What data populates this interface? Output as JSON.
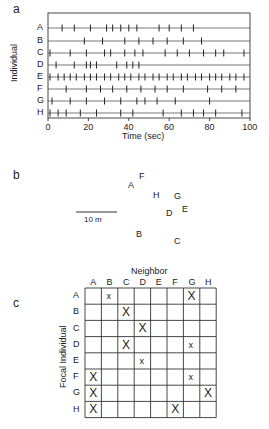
{
  "panels": {
    "a": {
      "label": "a"
    },
    "b": {
      "label": "b"
    },
    "c": {
      "label": "c"
    }
  },
  "chart_data": [
    {
      "type": "scatter",
      "subtype": "raster",
      "panel": "a",
      "xlabel": "Time (sec)",
      "ylabel": "Individual",
      "xlim": [
        0,
        100
      ],
      "xticks": [
        0,
        20,
        40,
        60,
        80,
        100
      ],
      "categories": [
        "A",
        "B",
        "C",
        "D",
        "E",
        "F",
        "G",
        "H"
      ],
      "series": [
        {
          "name": "A",
          "values": [
            7,
            13,
            21,
            29,
            32,
            36,
            40,
            44,
            55,
            60,
            66,
            72
          ]
        },
        {
          "name": "B",
          "values": [
            18,
            27,
            38,
            45,
            52,
            59,
            67,
            76
          ]
        },
        {
          "name": "C",
          "values": [
            1,
            11,
            19,
            28,
            31,
            38,
            43,
            47,
            58,
            64,
            70,
            77,
            83,
            87,
            97
          ]
        },
        {
          "name": "D",
          "values": [
            4,
            13,
            19,
            21,
            24,
            34,
            39,
            42,
            45
          ]
        },
        {
          "name": "E",
          "values": [
            1,
            5,
            8,
            11,
            14,
            18,
            21,
            24,
            28,
            31,
            35,
            38,
            41,
            45,
            48,
            52,
            55,
            59,
            62,
            66,
            69,
            73,
            76,
            80,
            83,
            86,
            90,
            93,
            97
          ]
        },
        {
          "name": "F",
          "values": [
            9,
            19,
            26,
            32,
            39,
            46,
            53,
            59,
            67,
            79,
            86,
            93
          ]
        },
        {
          "name": "G",
          "values": [
            2,
            11,
            19,
            28,
            36,
            44,
            48,
            54,
            63,
            80
          ]
        },
        {
          "name": "H",
          "values": [
            1,
            5,
            9,
            16,
            24,
            36,
            42,
            57,
            66,
            72,
            77,
            83,
            96
          ]
        }
      ]
    },
    {
      "type": "scatter",
      "subtype": "spatial-map",
      "panel": "b",
      "scale_bar": "10 m",
      "points": [
        {
          "name": "A",
          "x": 131,
          "y": 186
        },
        {
          "name": "F",
          "x": 142,
          "y": 177
        },
        {
          "name": "H",
          "x": 156,
          "y": 196
        },
        {
          "name": "G",
          "x": 177,
          "y": 197
        },
        {
          "name": "E",
          "x": 185,
          "y": 210
        },
        {
          "name": "D",
          "x": 169,
          "y": 214
        },
        {
          "name": "B",
          "x": 139,
          "y": 235
        },
        {
          "name": "C",
          "x": 177,
          "y": 242
        }
      ]
    },
    {
      "type": "table",
      "subtype": "matrix",
      "panel": "c",
      "title": "Neighbor",
      "row_label": "Focal Individual",
      "columns": [
        "A",
        "B",
        "C",
        "D",
        "E",
        "F",
        "G",
        "H"
      ],
      "rows": [
        "A",
        "B",
        "C",
        "D",
        "E",
        "F",
        "G",
        "H"
      ],
      "cells": [
        [
          "",
          "x",
          "",
          "",
          "",
          "",
          "X",
          ""
        ],
        [
          "",
          "",
          "X",
          "",
          "",
          "",
          "",
          ""
        ],
        [
          "",
          "",
          "",
          "X",
          "",
          "",
          "",
          ""
        ],
        [
          "",
          "",
          "X",
          "",
          "",
          "",
          "x",
          ""
        ],
        [
          "",
          "",
          "",
          "x",
          "",
          "",
          "",
          ""
        ],
        [
          "X",
          "",
          "",
          "",
          "",
          "",
          "x",
          ""
        ],
        [
          "X",
          "",
          "",
          "",
          "",
          "",
          "",
          "X"
        ],
        [
          "X",
          "",
          "",
          "",
          "",
          "X",
          "",
          ""
        ]
      ]
    }
  ]
}
